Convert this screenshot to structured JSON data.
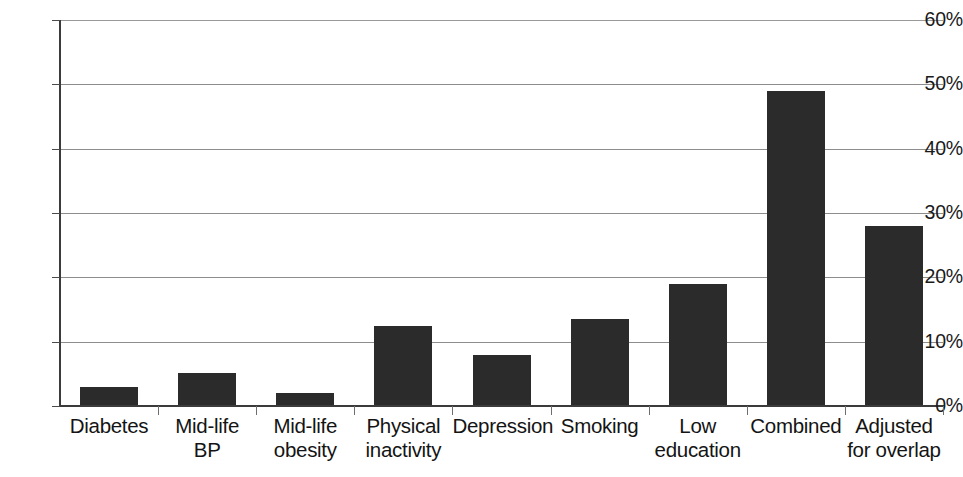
{
  "chart_data": {
    "type": "bar",
    "title": "",
    "subtitle": "",
    "xlabel": "",
    "ylabel": "",
    "ylim": [
      0,
      60
    ],
    "yunit": "%",
    "grid": true,
    "legend": false,
    "legend_position": "none",
    "bar_color": "#2b2b2b",
    "axis_color": "#3b3b3b",
    "gridline_color": "#8d8d8d",
    "background_color": "#ffffff",
    "ytick_labels": [
      "60%",
      "50%",
      "40%",
      "30%",
      "20%",
      "10%",
      "0%"
    ],
    "ytick_values": [
      60,
      50,
      40,
      30,
      20,
      10,
      0
    ],
    "categories": [
      "Diabetes",
      "Mid-life\nBP",
      "Mid-life\nobesity",
      "Physical\ninactivity",
      "Depression",
      "Smoking",
      "Low\neducation",
      "Combined",
      "Adjusted\nfor overlap"
    ],
    "values": [
      2.9,
      5.2,
      2.0,
      12.5,
      7.9,
      13.5,
      18.9,
      49.0,
      28.0
    ]
  }
}
